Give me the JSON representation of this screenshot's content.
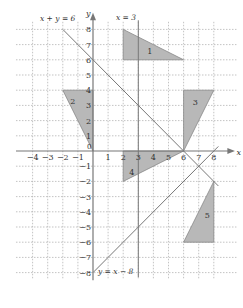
{
  "diagram": {
    "type": "coordinate-plane-transformations",
    "axes": {
      "x_label": "x",
      "y_label": "y",
      "x_ticks": [
        "-4",
        "-3",
        "-2",
        "-1",
        "0",
        "1",
        "2",
        "3",
        "4",
        "5",
        "6",
        "7",
        "8"
      ],
      "y_ticks": [
        "8",
        "7",
        "6",
        "5",
        "4",
        "3",
        "2",
        "1",
        "-1",
        "-2",
        "-3",
        "-4",
        "-5",
        "-6",
        "-7",
        "-8"
      ],
      "x_range": [
        -4,
        8
      ],
      "y_range": [
        -8,
        8
      ],
      "grid": "dotted"
    },
    "lines": [
      {
        "label": "x + y = 6",
        "from": [
          -2,
          8
        ],
        "to": [
          8.3,
          -2.3
        ]
      },
      {
        "label": "x = 3",
        "from": [
          3,
          8.6
        ],
        "to": [
          3,
          -8.3
        ]
      },
      {
        "label": "y = x − 8",
        "from": [
          0,
          -8
        ],
        "to": [
          8.3,
          0.3
        ]
      }
    ],
    "shapes": [
      {
        "label": "1",
        "vertices": [
          [
            2,
            8
          ],
          [
            2,
            6
          ],
          [
            6,
            6
          ]
        ]
      },
      {
        "label": "2",
        "vertices": [
          [
            -2,
            4
          ],
          [
            0,
            4
          ],
          [
            0,
            0
          ]
        ]
      },
      {
        "label": "3",
        "vertices": [
          [
            6,
            0
          ],
          [
            6,
            4
          ],
          [
            8,
            4
          ]
        ]
      },
      {
        "label": "4",
        "vertices": [
          [
            2,
            0
          ],
          [
            6,
            0
          ],
          [
            2,
            -2
          ]
        ]
      },
      {
        "label": "5",
        "vertices": [
          [
            8,
            -2
          ],
          [
            8,
            -6
          ],
          [
            6,
            -6
          ]
        ]
      }
    ],
    "colors": {
      "shape_fill": "#b8b8b8",
      "line": "#777777",
      "grid": "#aaaaaa",
      "text": "#333333"
    }
  }
}
